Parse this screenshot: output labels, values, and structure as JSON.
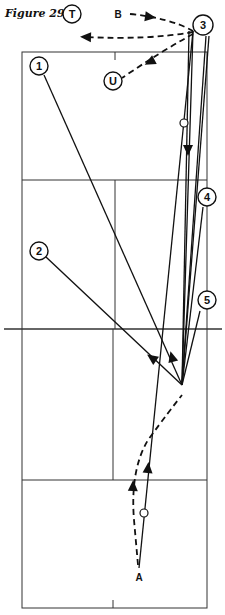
{
  "figure": {
    "title": "Figure 29",
    "type": "badminton/tennis court play diagram"
  },
  "colors": {
    "ink": "#111111",
    "court_line": "#333333",
    "background": "#ffffff"
  },
  "court": {
    "left": 22,
    "right": 207,
    "top": 52,
    "bottom": 608,
    "net_y": 329,
    "net_x1": 4,
    "net_x2": 222,
    "upper_service_y": 180,
    "lower_service_y": 480,
    "upper_center_x": 115,
    "lower_center_x": 113
  },
  "players": [
    {
      "id": "3",
      "label": "3",
      "x": 203,
      "y": 25,
      "r": 10
    },
    {
      "id": "T",
      "label": "T",
      "x": 72,
      "y": 14,
      "r": 9
    },
    {
      "id": "U",
      "label": "U",
      "x": 113,
      "y": 81,
      "r": 9
    },
    {
      "id": "1",
      "label": "1",
      "x": 39,
      "y": 66,
      "r": 9
    },
    {
      "id": "2",
      "label": "2",
      "x": 39,
      "y": 251,
      "r": 9
    },
    {
      "id": "4",
      "label": "4",
      "x": 207,
      "y": 197,
      "r": 9
    },
    {
      "id": "5",
      "label": "5",
      "x": 207,
      "y": 300,
      "r": 9
    }
  ],
  "labels": [
    {
      "id": "B",
      "text": "B",
      "x": 118,
      "y": 14
    },
    {
      "id": "A",
      "text": "A",
      "x": 139,
      "y": 577
    }
  ],
  "shot_point": {
    "x": 182,
    "y": 385
  },
  "player3_origin": {
    "x": 193,
    "y": 31
  },
  "solid_lines": [
    {
      "from": "1",
      "x1": 44,
      "y1": 75,
      "x2": 182,
      "y2": 385
    },
    {
      "from": "2",
      "x1": 46,
      "y1": 257,
      "x2": 182,
      "y2": 385
    },
    {
      "from": "3",
      "x1": 193,
      "y1": 31,
      "x2": 182,
      "y2": 385
    },
    {
      "from": "3",
      "x1": 189,
      "y1": 31,
      "x2": 182,
      "y2": 385
    },
    {
      "from": "3",
      "x1": 206,
      "y1": 36,
      "x2": 182,
      "y2": 385
    },
    {
      "from": "3",
      "x1": 209,
      "y1": 36,
      "x2": 182,
      "y2": 385
    },
    {
      "from": "4",
      "x1": 203,
      "y1": 207,
      "x2": 182,
      "y2": 385
    },
    {
      "from": "5",
      "x1": 200,
      "y1": 311,
      "x2": 182,
      "y2": 385
    },
    {
      "from": "A",
      "x1": 139,
      "y1": 568,
      "x2": 193,
      "y2": 31
    }
  ],
  "dashed_paths": [
    {
      "name": "3-to-T",
      "d": "M193,32 Q150,40 84,37"
    },
    {
      "name": "B-to-3",
      "d": "M130,14 Q170,18 193,31"
    },
    {
      "name": "3-to-U",
      "d": "M193,34 Q160,52 122,78"
    },
    {
      "name": "A-to-shot",
      "d": "M138,565 L134,520 Q130,470 148,440 Q170,410 182,395"
    }
  ],
  "arrowheads": [
    {
      "x": 86,
      "y": 37,
      "angle": 182
    },
    {
      "x": 150,
      "y": 17,
      "angle": 8
    },
    {
      "x": 150,
      "y": 62,
      "angle": 152
    },
    {
      "x": 188,
      "y": 150,
      "angle": 90
    },
    {
      "x": 152,
      "y": 358,
      "angle": 215
    },
    {
      "x": 172,
      "y": 357,
      "angle": 255
    },
    {
      "x": 148,
      "y": 468,
      "angle": 275
    },
    {
      "x": 133,
      "y": 486,
      "angle": 272
    }
  ],
  "shuttle_markers": [
    {
      "x": 184,
      "y": 123,
      "r": 4
    },
    {
      "x": 144,
      "y": 513,
      "r": 4
    }
  ]
}
